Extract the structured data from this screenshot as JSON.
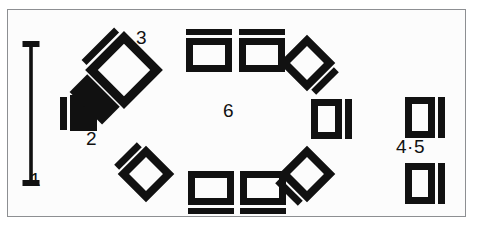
{
  "figure": {
    "background_color": "#ffffff",
    "frame_color": "#8d8f92",
    "ink_color": "#111111",
    "width": 478,
    "height": 233
  },
  "labels": {
    "one": "1",
    "two": "2",
    "three": "3",
    "four_five": "4·5",
    "six": "6"
  },
  "scale_bar": {
    "name": "scale-bar",
    "orientation": "vertical",
    "x": 31,
    "y_top": 41,
    "y_bottom": 186,
    "bar_width": 3.5,
    "cap_width": 17,
    "cap_height": 6,
    "label": "1"
  },
  "objects": [
    {
      "name": "solid-block",
      "label": "2",
      "type": "filled-rectangle-with-side-bar",
      "x": 60,
      "y": 96,
      "width": 37,
      "height": 35,
      "bar_width": 7,
      "bar_gap": 2,
      "bar_side": "left"
    },
    {
      "name": "rotated-frame-with-solid-block",
      "label": "3",
      "type": "rotated-hollow-square-plus-filled-bar",
      "center_x": 124,
      "center_y": 70,
      "size": 46,
      "stroke": 9,
      "rotation": 45,
      "companion_bar_side": "upper-left"
    },
    {
      "name": "hollow-rect-top-left",
      "type": "hollow-rectangle-with-bar",
      "x": 186,
      "y": 38,
      "width": 46,
      "height": 34,
      "stroke": 7,
      "bar_side": "top",
      "bar_thickness": 6,
      "bar_gap": 3
    },
    {
      "name": "hollow-rect-top-right",
      "type": "hollow-rectangle-with-bar",
      "x": 239,
      "y": 38,
      "width": 46,
      "height": 34,
      "stroke": 7,
      "bar_side": "top",
      "bar_thickness": 6,
      "bar_gap": 3
    },
    {
      "name": "diamond-upper-right",
      "type": "rotated-hollow-square-with-bar",
      "center_x": 307,
      "center_y": 63,
      "size": 40,
      "stroke": 8,
      "rotation": 45,
      "bar_side": "upper-right"
    },
    {
      "name": "hollow-rect-right-middle",
      "type": "hollow-rectangle-with-bar",
      "x": 311,
      "y": 99,
      "width": 31,
      "height": 40,
      "stroke": 7,
      "bar_side": "right",
      "bar_thickness": 7,
      "bar_gap": 3
    },
    {
      "name": "diamond-lower-right",
      "type": "rotated-hollow-square-with-bar",
      "center_x": 307,
      "center_y": 174,
      "size": 40,
      "stroke": 8,
      "rotation": 45,
      "bar_side": "lower-right"
    },
    {
      "name": "hollow-rect-bottom-left",
      "type": "hollow-rectangle-with-bar",
      "x": 188,
      "y": 171,
      "width": 46,
      "height": 34,
      "stroke": 7,
      "bar_side": "bottom",
      "bar_thickness": 6,
      "bar_gap": 3
    },
    {
      "name": "hollow-rect-bottom-right",
      "type": "hollow-rectangle-with-bar",
      "x": 240,
      "y": 171,
      "width": 46,
      "height": 34,
      "stroke": 7,
      "bar_side": "bottom",
      "bar_thickness": 6,
      "bar_gap": 3
    },
    {
      "name": "diamond-lower-left",
      "type": "rotated-hollow-square-with-bar",
      "center_x": 146,
      "center_y": 174,
      "size": 40,
      "stroke": 8,
      "rotation": 45,
      "bar_side": "lower-left"
    },
    {
      "name": "diamond-upper-left",
      "type": "rotated-hollow-square-with-bar",
      "center_x": 124,
      "center_y": 70,
      "size": 40,
      "stroke": 8,
      "rotation": 45,
      "bar_side": "upper-left"
    },
    {
      "name": "hollow-rect-far-right-top",
      "label": "4",
      "type": "hollow-rectangle-with-bar",
      "x": 405,
      "y": 97,
      "width": 30,
      "height": 41,
      "stroke": 7,
      "bar_side": "right",
      "bar_thickness": 7,
      "bar_gap": 3
    },
    {
      "name": "hollow-rect-far-right-bottom",
      "label": "5",
      "type": "hollow-rectangle-with-bar",
      "x": 405,
      "y": 163,
      "width": 30,
      "height": 41,
      "stroke": 7,
      "bar_side": "right",
      "bar_thickness": 7,
      "bar_gap": 3
    }
  ]
}
